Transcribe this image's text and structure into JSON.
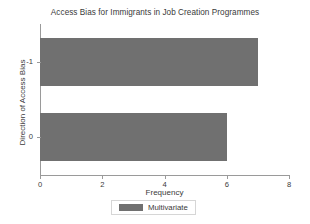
{
  "chart_data": {
    "type": "bar",
    "orientation": "horizontal",
    "title": "Access Bias for Immigrants in Job Creation Programmes",
    "xlabel": "Frequency",
    "ylabel": "Direction of Access Bias",
    "categories": [
      "-1",
      "0"
    ],
    "values": [
      7,
      6
    ],
    "series": [
      {
        "name": "Multivariate",
        "values": [
          7,
          6
        ],
        "color": "#707070"
      }
    ],
    "xlim": [
      0,
      8
    ],
    "xticks": [
      "0",
      "2",
      "4",
      "6",
      "8"
    ],
    "xtick_values": [
      0,
      2,
      4,
      6,
      8
    ],
    "yticks": [
      "-1",
      "0"
    ],
    "grid": false,
    "legend": {
      "position": "bottom",
      "entries": [
        {
          "label": "Multivariate",
          "color": "#707070"
        }
      ]
    },
    "background_color": "#ffffff",
    "axis_color": "#9a9a9a",
    "text_color": "#3a3a3a"
  }
}
